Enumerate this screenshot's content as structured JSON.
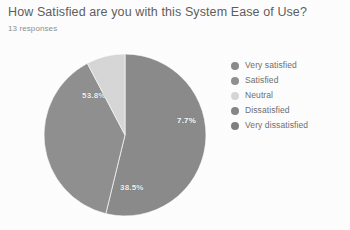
{
  "header": {
    "title": "How Satisfied are you with this System Ease of Use?",
    "response_count": "13 responses"
  },
  "chart_data": {
    "type": "pie",
    "title": "How Satisfied are you with this System Ease of Use?",
    "subtitle": "13 responses",
    "total_responses": 13,
    "labels": [
      "Very satisfied",
      "Satisfied",
      "Neutral",
      "Dissatisfied",
      "Very dissatisfied"
    ],
    "values": [
      53.8,
      38.5,
      7.7,
      0,
      0
    ],
    "counts": [
      7,
      5,
      1,
      0,
      0
    ],
    "value_labels": [
      "53.8%",
      "38.5%",
      "7.7%",
      "",
      ""
    ],
    "visible_slice_labels": [
      "53.8%",
      "38.5%",
      "7.7%"
    ],
    "colors": [
      "#8a8a8a",
      "#8f8f8f",
      "#d6d6d6",
      "#868686",
      "#7e7e7e"
    ],
    "legend_position": "right",
    "grid": false,
    "xlabel": "",
    "ylabel": ""
  },
  "legend": {
    "items": [
      {
        "label": "Very satisfied",
        "color": "#8a8a8a"
      },
      {
        "label": "Satisfied",
        "color": "#8f8f8f"
      },
      {
        "label": "Neutral",
        "color": "#d6d6d6"
      },
      {
        "label": "Dissatisfied",
        "color": "#868686"
      },
      {
        "label": "Very dissatisfied",
        "color": "#7e7e7e"
      }
    ]
  },
  "slice_labels": {
    "very_satisfied": "53.8%",
    "satisfied": "38.5%",
    "neutral": "7.7%"
  }
}
